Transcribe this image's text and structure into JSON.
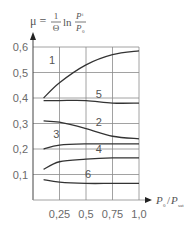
{
  "chart_data": {
    "type": "line",
    "title": "",
    "formula": {
      "lhs": "μ =",
      "frac_num": "1",
      "frac_den": "Θ",
      "ln": "ln",
      "p_num": "P",
      "p_num_sub": "i",
      "p_den": "P",
      "p_den_sub": "0"
    },
    "xlabel": "P0/Psat",
    "xlabel_parts": {
      "p1": "P",
      "s1": "0",
      "slash": "/",
      "p2": "P",
      "s2": "sat"
    },
    "ylabel": "μ",
    "xlim": [
      0,
      1.0
    ],
    "ylim": [
      0,
      0.6
    ],
    "x_ticks": [
      "0,25",
      "0,5",
      "0,75",
      "1,0"
    ],
    "y_ticks": [
      "0,1",
      "0,2",
      "0,3",
      "0,4",
      "0,5",
      "0,6"
    ],
    "grid": true,
    "x": [
      0.1,
      0.25,
      0.5,
      0.75,
      1.0
    ],
    "series": [
      {
        "name": "1",
        "values": [
          0.4,
          0.46,
          0.53,
          0.57,
          0.585
        ]
      },
      {
        "name": "2",
        "values": [
          0.31,
          0.305,
          0.28,
          0.25,
          0.24
        ]
      },
      {
        "name": "3",
        "values": [
          0.2,
          0.215,
          0.22,
          0.22,
          0.22
        ]
      },
      {
        "name": "4",
        "values": [
          0.12,
          0.15,
          0.16,
          0.165,
          0.165
        ]
      },
      {
        "name": "5",
        "values": [
          0.39,
          0.39,
          0.39,
          0.38,
          0.38
        ]
      },
      {
        "name": "6",
        "values": [
          0.08,
          0.07,
          0.065,
          0.065,
          0.065
        ]
      }
    ]
  }
}
